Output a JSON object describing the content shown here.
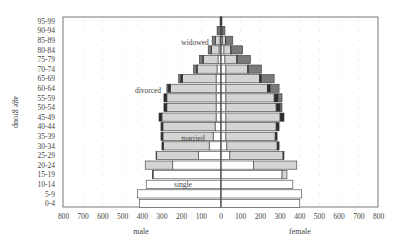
{
  "chart_data": {
    "type": "bar",
    "subtype": "population-pyramid-stacked",
    "title": "",
    "xlabel_left": "male",
    "xlabel_right": "female",
    "ylabel": "age group",
    "xlim": [
      -800,
      800
    ],
    "xticks": [
      "800",
      "700",
      "600",
      "500",
      "400",
      "300",
      "200",
      "100",
      "0",
      "100",
      "200",
      "300",
      "400",
      "500",
      "600",
      "700",
      "800"
    ],
    "grid": "dotted",
    "categories": [
      "0-4",
      "5-9",
      "10-14",
      "15-19",
      "20-24",
      "25-29",
      "30-34",
      "35-39",
      "40-44",
      "45-49",
      "50-54",
      "55-59",
      "60-64",
      "65-69",
      "70-74",
      "75-79",
      "80-84",
      "85-89",
      "90-94",
      "95-99"
    ],
    "segment_order": [
      "single",
      "married",
      "divorced",
      "widowed"
    ],
    "colors": {
      "single": "#ffffff",
      "married": "#d4d4d4",
      "divorced": "#2b2b2b",
      "widowed": "#7a7a7a"
    },
    "annotations": [
      {
        "text": "widowed",
        "age": "85-89",
        "side": "left"
      },
      {
        "text": "divorced",
        "age": "60-64",
        "side": "left"
      },
      {
        "text": "married",
        "age": "35-39",
        "side": "left"
      },
      {
        "text": "single",
        "age": "10-14",
        "side": "left"
      }
    ],
    "series": {
      "male": {
        "single": [
          415,
          425,
          380,
          345,
          245,
          115,
          60,
          40,
          30,
          25,
          25,
          25,
          25,
          25,
          20,
          15,
          10,
          5,
          2,
          1
        ],
        "married": [
          0,
          0,
          0,
          0,
          140,
          212,
          232,
          255,
          265,
          275,
          250,
          250,
          232,
          170,
          100,
          75,
          38,
          22,
          8,
          1
        ],
        "divorced": [
          0,
          0,
          0,
          3,
          0,
          3,
          8,
          10,
          10,
          15,
          15,
          15,
          12,
          10,
          5,
          3,
          2,
          1,
          0,
          0
        ],
        "widowed": [
          0,
          0,
          0,
          0,
          0,
          0,
          0,
          0,
          0,
          0,
          0,
          0,
          6,
          10,
          15,
          17,
          15,
          17,
          10,
          3
        ]
      },
      "female": {
        "single": [
          400,
          410,
          365,
          310,
          165,
          45,
          30,
          25,
          25,
          25,
          25,
          25,
          25,
          25,
          25,
          20,
          15,
          8,
          3,
          1
        ],
        "married": [
          0,
          0,
          0,
          25,
          220,
          270,
          255,
          250,
          255,
          275,
          255,
          245,
          210,
          170,
          110,
          60,
          35,
          15,
          5,
          1
        ],
        "divorced": [
          0,
          0,
          0,
          0,
          0,
          5,
          10,
          10,
          15,
          20,
          20,
          20,
          15,
          10,
          5,
          3,
          2,
          1,
          0,
          0
        ],
        "widowed": [
          0,
          0,
          0,
          0,
          0,
          0,
          0,
          0,
          0,
          0,
          10,
          20,
          45,
          65,
          65,
          67,
          58,
          36,
          12,
          3
        ]
      }
    }
  }
}
